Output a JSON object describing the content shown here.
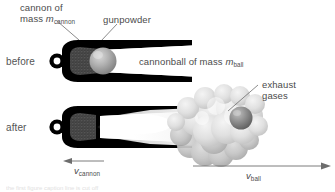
{
  "figure": {
    "background_color": "#ffffff",
    "text_color": "#4b4b4b",
    "cannon_body_color": "#000000",
    "gunpowder_color": "#4d4d4d",
    "ball_color": "#9a9a9a",
    "smoke_color": "#d8d8d8"
  },
  "labels": {
    "cannon_mass_line1": "cannon of",
    "cannon_mass_line2_text": "mass",
    "cannon_mass_symbol": "m",
    "cannon_mass_subscript": "cannon",
    "gunpowder": "gunpowder",
    "cannonball_text": "cannonball of mass",
    "cannonball_symbol": "m",
    "cannonball_subscript": "ball",
    "exhaust_line1": "exhaust",
    "exhaust_line2": "gases",
    "before": "before",
    "after": "after"
  },
  "vectors": {
    "cannon_velocity_symbol": "v",
    "cannon_velocity_subscript": "cannon",
    "cannon_velocity_direction": "left",
    "ball_velocity_symbol": "v",
    "ball_velocity_subscript": "ball",
    "ball_velocity_direction": "right"
  },
  "caption": {
    "cut_off_text": "the first figure caption line is cut off"
  }
}
